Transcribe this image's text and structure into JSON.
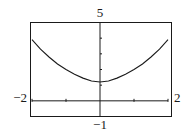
{
  "chart_data": {
    "type": "line",
    "title": "",
    "xlabel": "",
    "ylabel": "",
    "xlim": [
      -2,
      2
    ],
    "ylim": [
      -1,
      5
    ],
    "grid": false,
    "window_labels": {
      "xmin": "−2",
      "xmax": "2",
      "ymin": "−1",
      "ymax": "5"
    },
    "x_ticks": [
      -2,
      -1,
      0,
      1,
      2
    ],
    "y_ticks": [
      1,
      2,
      3,
      4,
      5
    ],
    "series": [
      {
        "name": "curve",
        "x": [
          -2,
          -1.75,
          -1.5,
          -1.25,
          -1,
          -0.75,
          -0.5,
          -0.25,
          0,
          0.25,
          0.5,
          0.75,
          1,
          1.25,
          1.5,
          1.75,
          2
        ],
        "y": [
          3.9,
          3.3,
          2.8,
          2.35,
          2.0,
          1.7,
          1.45,
          1.27,
          1.2,
          1.27,
          1.45,
          1.7,
          2.0,
          2.35,
          2.8,
          3.3,
          3.9
        ]
      }
    ],
    "color": "#1a1a1a"
  }
}
